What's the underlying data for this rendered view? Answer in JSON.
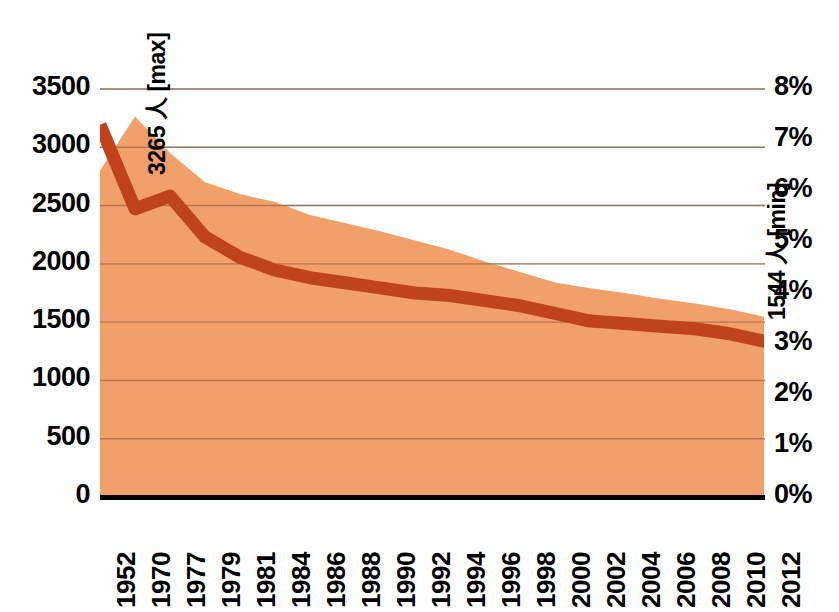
{
  "chart_data": {
    "type": "area",
    "title": "",
    "subtitle": "",
    "xlabel": "",
    "ylabel_left": "",
    "ylabel_right": "",
    "grid": true,
    "legend_position": "none",
    "categories": [
      "1952",
      "1970",
      "1977",
      "1979",
      "1981",
      "1984",
      "1986",
      "1988",
      "1990",
      "1992",
      "1994",
      "1996",
      "1998",
      "2000",
      "2002",
      "2004",
      "2006",
      "2008",
      "2010",
      "2012"
    ],
    "x_tick_labels": [
      "1952",
      "1970",
      "1977",
      "1979",
      "1981",
      "1984",
      "1986",
      "1988",
      "1990",
      "1992",
      "1994",
      "1996",
      "1998",
      "2000",
      "2002",
      "2004",
      "2006",
      "2008",
      "2010",
      "2012"
    ],
    "left_axis": {
      "ticks": [
        0,
        500,
        1000,
        1500,
        2000,
        2500,
        3000,
        3500
      ],
      "tick_labels": [
        "0",
        "500",
        "1000",
        "1500",
        "2000",
        "2500",
        "3000",
        "3500"
      ],
      "ylim": [
        0,
        3500
      ]
    },
    "right_axis": {
      "ticks": [
        0,
        1,
        2,
        3,
        4,
        5,
        6,
        7,
        8
      ],
      "tick_labels": [
        "0%",
        "1%",
        "2%",
        "3%",
        "4%",
        "5%",
        "6%",
        "7%",
        "8%"
      ],
      "ylim": [
        0,
        8
      ],
      "unit": "%"
    },
    "series": [
      {
        "name": "area-series",
        "axis": "left",
        "kind": "area",
        "color": "#F2A06A",
        "x": [
          1952,
          1970,
          1977,
          1979,
          1981,
          1984,
          1986,
          1988,
          1990,
          1992,
          1994,
          1996,
          1998,
          2000,
          2002,
          2004,
          2006,
          2008,
          2010,
          2012
        ],
        "values": [
          2800,
          3265,
          2950,
          2700,
          2600,
          2530,
          2420,
          2350,
          2280,
          2200,
          2120,
          2020,
          1930,
          1840,
          1790,
          1750,
          1700,
          1660,
          1610,
          1544
        ]
      },
      {
        "name": "line-series",
        "axis": "right",
        "kind": "line",
        "color": "#C0431C",
        "x": [
          1952,
          1970,
          1977,
          1979,
          1981,
          1984,
          1986,
          1988,
          1990,
          1992,
          1994,
          1996,
          1998,
          2000,
          2002,
          2004,
          2006,
          2008,
          2010,
          2012
        ],
        "values": [
          7.3,
          5.65,
          5.9,
          5.1,
          4.7,
          4.45,
          4.3,
          4.2,
          4.1,
          4.0,
          3.95,
          3.85,
          3.75,
          3.6,
          3.45,
          3.4,
          3.35,
          3.3,
          3.2,
          3.05
        ]
      }
    ],
    "annotations": [
      {
        "name": "max-annotation",
        "text": "3265 人 [max]",
        "value": 3265,
        "unit": "人",
        "kind": "max"
      },
      {
        "name": "min-annotation",
        "text": "1544 人 [min]",
        "value": 1544,
        "unit": "人",
        "kind": "min"
      }
    ],
    "colors": {
      "area_fill": "#F2A06A",
      "line": "#C0431C",
      "gridline": "#A8A8A8",
      "gridline_over_area": "#8C5230",
      "axis": "#000000",
      "text": "#000000",
      "background": "#FFFFFF"
    }
  }
}
